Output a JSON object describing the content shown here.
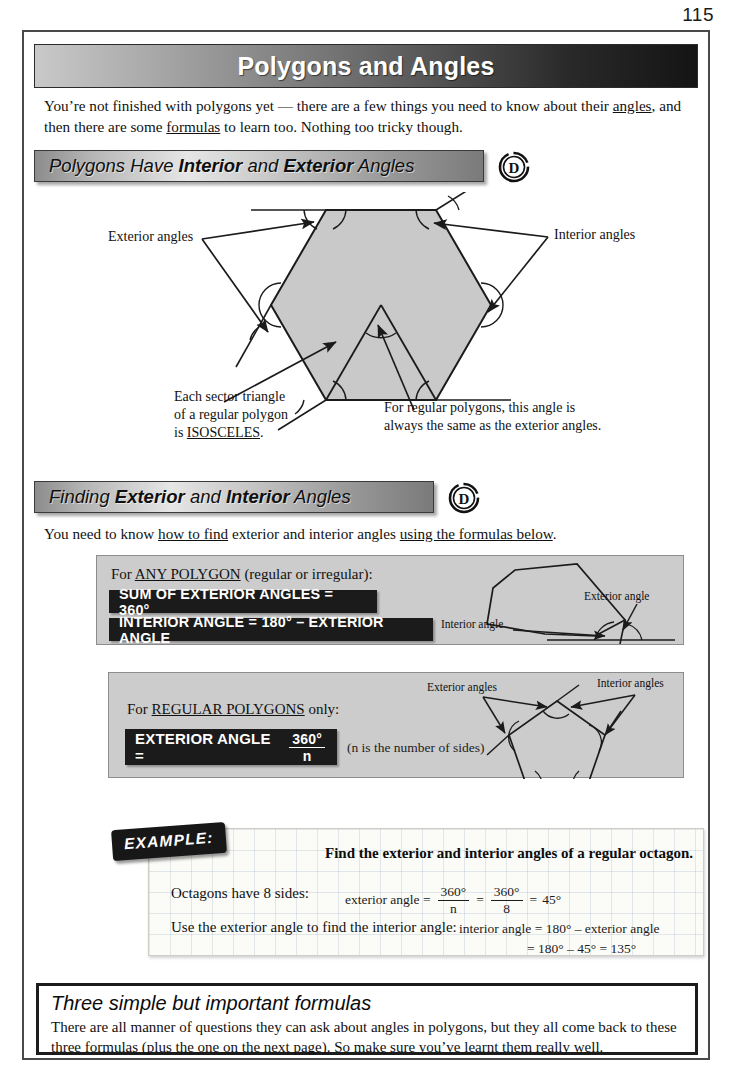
{
  "page": {
    "number": "115"
  },
  "header": {
    "title": "Polygons and Angles"
  },
  "intro": {
    "part1": "You’re not finished with polygons yet — there are a few things you need to know about their ",
    "link1": "angles",
    "part2": ", and then there are some ",
    "link2": "formulas",
    "part3": " to learn too.  Nothing too tricky though."
  },
  "section1": {
    "heading_plain1": "Polygons Have ",
    "heading_bold1": "Interior",
    "heading_plain2": " and ",
    "heading_bold2": "Exterior",
    "heading_plain3": " Angles",
    "grade_badge": "D",
    "labels": {
      "exterior": "Exterior angles",
      "interior": "Interior angles",
      "note_left_l1": "Each sector triangle",
      "note_left_l2": "of a regular polygon",
      "note_left_l3_pre": "is ",
      "note_left_l3_underline": "ISOSCELES",
      "note_left_l3_post": ".",
      "note_right_l1": "For regular polygons, this angle is",
      "note_right_l2": "always the same as the exterior angles."
    }
  },
  "section2": {
    "heading_plain1": "Finding ",
    "heading_bold1": "Exterior",
    "heading_plain2": " and ",
    "heading_bold2": "Interior",
    "heading_plain3": " Angles",
    "grade_badge": "D",
    "intro_part1": "You need to know ",
    "intro_link1": "how to find",
    "intro_part2": " exterior and interior angles ",
    "intro_link2": "using the formulas below",
    "intro_part3": "."
  },
  "panel_any": {
    "lead_pre": "For ",
    "lead_underline": "ANY POLYGON",
    "lead_post": " (regular or irregular):",
    "formula1": "SUM OF EXTERIOR ANGLES = 360°",
    "formula2": "INTERIOR ANGLE = 180° – EXTERIOR ANGLE",
    "diagram_label_exterior": "Exterior angle",
    "diagram_label_interior": "Interior angle"
  },
  "panel_regular": {
    "lead_pre": "For ",
    "lead_underline": "REGULAR POLYGONS",
    "lead_post": " only:",
    "formula_label": "EXTERIOR ANGLE  =",
    "formula_numerator": "360°",
    "formula_denominator": "n",
    "note": "(n is the number of sides)",
    "diagram_label_exterior": "Exterior angles",
    "diagram_label_interior": "Interior angles"
  },
  "example": {
    "tag": "EXAMPLE:",
    "question": "Find the exterior and interior angles of a regular octagon.",
    "line1_lead": "Octagons have 8 sides:",
    "line1_math_label": "exterior angle =",
    "line1_frac1_num": "360°",
    "line1_frac1_den": "n",
    "line1_eq1": "=",
    "line1_frac2_num": "360°",
    "line1_frac2_den": "8",
    "line1_eq2": "=",
    "line1_result": "45°",
    "line2_lead": "Use the exterior angle to find the interior angle:",
    "line2_math": "interior angle = 180° – exterior angle",
    "line3_math": "= 180° – 45° = 135°"
  },
  "summary": {
    "title": "Three simple but important formulas",
    "text": "There are all manner of questions they can ask about angles in polygons, but they all come back to these three formulas (plus the one on the next page).  So make sure you’ve learnt them really well."
  },
  "colors": {
    "ink": "#111111",
    "panel_grey": "#cccccc",
    "formula_black": "#1b1b1b",
    "shape_fill": "#c9c9c9",
    "frame": "#4a4a4a"
  }
}
